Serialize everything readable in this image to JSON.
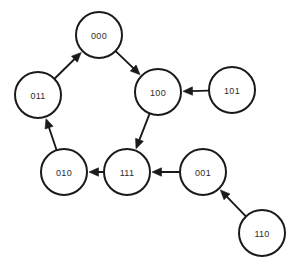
{
  "diagram": {
    "type": "directed-graph",
    "canvas": {
      "width": 299,
      "height": 267,
      "background": "#ffffff"
    },
    "style": {
      "node_fill": "#ffffff",
      "node_stroke": "#1a1a1a",
      "node_stroke_width": 2,
      "node_radius": 23,
      "edge_color": "#1a1a1a",
      "edge_width": 1.9,
      "label_color": "#2b2b2b",
      "label_size": 9
    },
    "nodes": [
      {
        "id": "000",
        "label": "000",
        "cx": 99,
        "cy": 35,
        "r": 23
      },
      {
        "id": "011",
        "label": "011",
        "cx": 38,
        "cy": 95,
        "r": 23
      },
      {
        "id": "100",
        "label": "100",
        "cx": 158,
        "cy": 92,
        "r": 23
      },
      {
        "id": "101",
        "label": "101",
        "cx": 232,
        "cy": 90,
        "r": 23
      },
      {
        "id": "010",
        "label": "010",
        "cx": 64,
        "cy": 172,
        "r": 23
      },
      {
        "id": "111",
        "label": "111",
        "cx": 127,
        "cy": 172,
        "r": 23
      },
      {
        "id": "001",
        "label": "001",
        "cx": 203,
        "cy": 172,
        "r": 23
      },
      {
        "id": "110",
        "label": "110",
        "cx": 262,
        "cy": 233,
        "r": 23
      }
    ],
    "edges": [
      {
        "from": "011",
        "to": "000",
        "arrow": "to"
      },
      {
        "from": "000",
        "to": "100",
        "arrow": "to"
      },
      {
        "from": "101",
        "to": "100",
        "arrow": "to"
      },
      {
        "from": "100",
        "to": "111",
        "arrow": "to"
      },
      {
        "from": "001",
        "to": "111",
        "arrow": "to"
      },
      {
        "from": "111",
        "to": "010",
        "arrow": "to"
      },
      {
        "from": "010",
        "to": "011",
        "arrow": "to"
      },
      {
        "from": "110",
        "to": "001",
        "arrow": "to"
      }
    ]
  }
}
